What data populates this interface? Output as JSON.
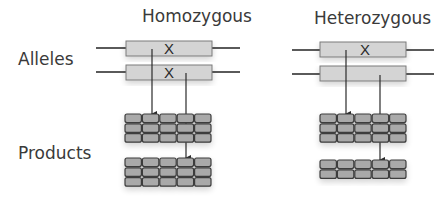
{
  "columns": [
    {
      "title": "Homozygous",
      "alleles": [
        {
          "mutated": true
        },
        {
          "mutated": true
        }
      ],
      "product_rows": [
        3,
        3
      ]
    },
    {
      "title": "Heterozygous",
      "alleles": [
        {
          "mutated": true
        },
        {
          "mutated": false
        }
      ],
      "product_rows": [
        3,
        2
      ]
    }
  ],
  "row_labels": {
    "alleles": "Alleles",
    "products": "Products"
  },
  "mutation_mark": "X",
  "colors": {
    "gene_fill": "#d4d4d4",
    "gene_stroke": "#7a7a7a",
    "line": "#5a5a5a",
    "block_fill": "#a9a9a9",
    "block_stroke": "#3c3c3c",
    "arrow": "#2a2a2a",
    "text": "#3a3a3a"
  }
}
